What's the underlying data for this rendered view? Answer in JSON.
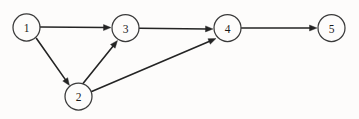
{
  "diagram": {
    "background_color": "#fdfcfb",
    "node_stroke_color": "#3a3a3a",
    "node_fill_color": "#fdfcfb",
    "edge_color": "#242424",
    "label_color": "#1a1a1a",
    "node_radius": 13.5,
    "nodes": [
      {
        "id": "1",
        "label": "1",
        "cx": 26.5,
        "cy": 27.5
      },
      {
        "id": "2",
        "label": "2",
        "cx": 78.5,
        "cy": 96.5
      },
      {
        "id": "3",
        "label": "3",
        "cx": 125.5,
        "cy": 28.0
      },
      {
        "id": "4",
        "label": "4",
        "cx": 227.5,
        "cy": 28.0
      },
      {
        "id": "5",
        "label": "5",
        "cx": 331.5,
        "cy": 28.0
      }
    ],
    "edges": [
      {
        "from": "1",
        "to": "3",
        "directed": true,
        "x1": 40.0,
        "y1": 27.0,
        "x2": 111.0,
        "y2": 27.6
      },
      {
        "from": "1",
        "to": "2",
        "directed": true,
        "x1": 36.5,
        "y1": 38.5,
        "x2": 69.5,
        "y2": 85.5
      },
      {
        "from": "2",
        "to": "3",
        "directed": true,
        "x1": 83.0,
        "y1": 83.5,
        "x2": 117.5,
        "y2": 40.5
      },
      {
        "from": "2",
        "to": "4",
        "directed": true,
        "x1": 90.5,
        "y1": 92.0,
        "x2": 216.0,
        "y2": 38.5
      },
      {
        "from": "3",
        "to": "4",
        "directed": true,
        "x1": 139.5,
        "y1": 28.2,
        "x2": 213.0,
        "y2": 29.0
      },
      {
        "from": "4",
        "to": "5",
        "directed": true,
        "x1": 241.5,
        "y1": 28.0,
        "x2": 317.0,
        "y2": 28.0
      }
    ]
  }
}
